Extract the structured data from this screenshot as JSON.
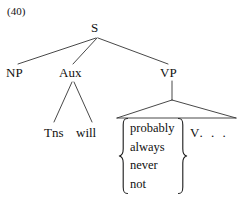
{
  "figure": {
    "example_number": "(40)",
    "type": "syntax-tree",
    "ink_color": "#111111",
    "background_color": "#ffffff"
  },
  "tree": {
    "root": {
      "label": "S",
      "children": [
        {
          "label": "NP"
        },
        {
          "label": "Aux",
          "children": [
            {
              "label": "Tns"
            },
            {
              "label": "will"
            }
          ]
        },
        {
          "label": "VP",
          "children": [
            {
              "label": "adverb-set"
            },
            {
              "label": "V . . ."
            }
          ]
        }
      ]
    },
    "nodes": {
      "s": "S",
      "np": "NP",
      "aux": "Aux",
      "vp": "VP",
      "tns": "Tns",
      "will": "will",
      "v": "V",
      "v_ellipsis": ". . ."
    }
  },
  "adverb_set": {
    "brace_left": "{",
    "brace_right": "}",
    "items": [
      "probably",
      "always",
      "never",
      "not"
    ]
  }
}
